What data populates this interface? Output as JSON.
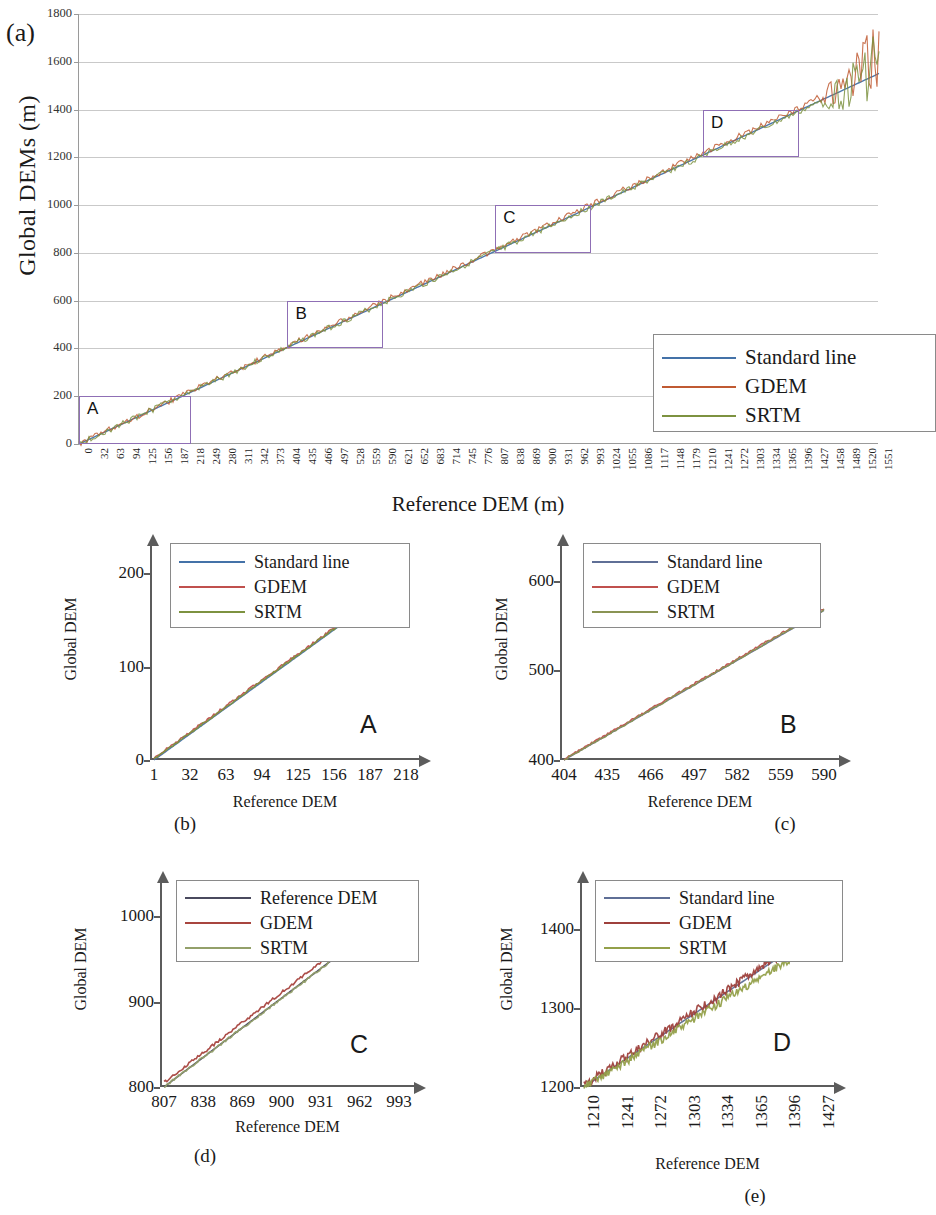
{
  "figure": {
    "panels": [
      {
        "tag": "(a)"
      },
      {
        "tag": "(b)"
      },
      {
        "tag": "(c)"
      },
      {
        "tag": "(d)"
      },
      {
        "tag": "(e)"
      }
    ]
  },
  "panel_a": {
    "tag": "(a)",
    "ylabel": "Global DEMs (m)",
    "xlabel": "Reference DEM (m)",
    "legend": [
      {
        "label": "Standard line",
        "color": "#4472a8"
      },
      {
        "label": "GDEM",
        "color": "#c05a32"
      },
      {
        "label": "SRTM",
        "color": "#7d9240"
      }
    ],
    "yticks": [
      "0",
      "200",
      "400",
      "600",
      "800",
      "1000",
      "1200",
      "1400",
      "1600",
      "1800"
    ],
    "xticks": [
      "0",
      "32",
      "63",
      "94",
      "125",
      "156",
      "187",
      "218",
      "249",
      "280",
      "311",
      "342",
      "373",
      "404",
      "435",
      "466",
      "497",
      "528",
      "559",
      "590",
      "621",
      "652",
      "683",
      "714",
      "745",
      "776",
      "807",
      "838",
      "869",
      "900",
      "931",
      "962",
      "993",
      "1024",
      "1055",
      "1086",
      "1117",
      "1148",
      "1179",
      "1210",
      "1241",
      "1272",
      "1303",
      "1334",
      "1365",
      "1396",
      "1427",
      "1458",
      "1489",
      "1520",
      "1551"
    ],
    "boxes": [
      {
        "label": "A",
        "color": "#8f6fb5"
      },
      {
        "label": "B",
        "color": "#8f6fb5"
      },
      {
        "label": "C",
        "color": "#8f6fb5"
      },
      {
        "label": "D",
        "color": "#8f6fb5"
      }
    ]
  },
  "panel_b": {
    "caption": "(b)",
    "zone": "A",
    "ylabel": "Global DEM",
    "xlabel": "Reference DEM",
    "yticks": [
      "0",
      "100",
      "200"
    ],
    "xticks": [
      "1",
      "32",
      "63",
      "94",
      "125",
      "156",
      "187",
      "218"
    ],
    "legend": [
      {
        "label": "Standard line",
        "color": "#4472a8"
      },
      {
        "label": "GDEM",
        "color": "#c0504d"
      },
      {
        "label": "SRTM",
        "color": "#7d9240"
      }
    ]
  },
  "panel_c": {
    "caption": "(c)",
    "zone": "B",
    "ylabel": "Global DEM",
    "xlabel": "Reference DEM",
    "yticks": [
      "400",
      "500",
      "600"
    ],
    "xticks": [
      "404",
      "435",
      "466",
      "497",
      "582",
      "559",
      "590"
    ],
    "legend": [
      {
        "label": "Standard line",
        "color": "#5f6f96"
      },
      {
        "label": "GDEM",
        "color": "#c0504d"
      },
      {
        "label": "SRTM",
        "color": "#8a9454"
      }
    ]
  },
  "panel_d": {
    "caption": "(d)",
    "zone": "C",
    "ylabel": "Global DEM",
    "xlabel": "Reference DEM",
    "yticks": [
      "800",
      "900",
      "1000"
    ],
    "xticks": [
      "807",
      "838",
      "869",
      "900",
      "931",
      "962",
      "993"
    ],
    "legend": [
      {
        "label": "Reference DEM",
        "color": "#4a4a5e"
      },
      {
        "label": "GDEM",
        "color": "#a8453f"
      },
      {
        "label": "SRTM",
        "color": "#93a06a"
      }
    ]
  },
  "panel_e": {
    "caption": "(e)",
    "zone": "D",
    "ylabel": "Global DEM",
    "xlabel": "Reference DEM",
    "yticks": [
      "1200",
      "1300",
      "1400"
    ],
    "xticks": [
      "1210",
      "1241",
      "1272",
      "1303",
      "1334",
      "1365",
      "1396",
      "1427"
    ],
    "legend": [
      {
        "label": "Standard line",
        "color": "#5f6f96"
      },
      {
        "label": "GDEM",
        "color": "#9e403c"
      },
      {
        "label": "SRTM",
        "color": "#93a04a"
      }
    ]
  },
  "chart_data": [
    {
      "type": "line",
      "panel": "(a)",
      "title": "",
      "xlabel": "Reference DEM (m)",
      "ylabel": "Global DEMs (m)",
      "xlim": [
        0,
        1551
      ],
      "ylim": [
        0,
        1800
      ],
      "grid": true,
      "legend_position": "lower-right",
      "xticks": [
        0,
        32,
        63,
        94,
        125,
        156,
        187,
        218,
        249,
        280,
        311,
        342,
        373,
        404,
        435,
        466,
        497,
        528,
        559,
        590,
        621,
        652,
        683,
        714,
        745,
        776,
        807,
        838,
        869,
        900,
        931,
        962,
        993,
        1024,
        1055,
        1086,
        1117,
        1148,
        1179,
        1210,
        1241,
        1272,
        1303,
        1334,
        1365,
        1396,
        1427,
        1458,
        1489,
        1520,
        1551
      ],
      "yticks": [
        0,
        200,
        400,
        600,
        800,
        1000,
        1200,
        1400,
        1600,
        1800
      ],
      "series": [
        {
          "name": "Standard line",
          "color": "#4472a8",
          "x": [
            0,
            200,
            400,
            600,
            800,
            1000,
            1200,
            1400,
            1500,
            1551
          ],
          "values": [
            0,
            200,
            400,
            600,
            800,
            1000,
            1200,
            1400,
            1500,
            1551
          ]
        },
        {
          "name": "GDEM",
          "color": "#c05a32",
          "x": [
            0,
            200,
            400,
            600,
            800,
            1000,
            1200,
            1400,
            1500,
            1551
          ],
          "values": [
            2,
            204,
            406,
            607,
            808,
            1008,
            1210,
            1408,
            1520,
            1650
          ]
        },
        {
          "name": "SRTM",
          "color": "#7d9240",
          "x": [
            0,
            200,
            400,
            600,
            800,
            1000,
            1200,
            1400,
            1500,
            1551
          ],
          "values": [
            1,
            201,
            401,
            601,
            800,
            1000,
            1198,
            1394,
            1490,
            1630
          ]
        }
      ],
      "annotations": [
        {
          "label": "A",
          "x_range": [
            0,
            218
          ],
          "y_range": [
            0,
            200
          ]
        },
        {
          "label": "B",
          "x_range": [
            404,
            590
          ],
          "y_range": [
            400,
            600
          ]
        },
        {
          "label": "C",
          "x_range": [
            807,
            993
          ],
          "y_range": [
            800,
            1000
          ]
        },
        {
          "label": "D",
          "x_range": [
            1210,
            1396
          ],
          "y_range": [
            1200,
            1400
          ]
        }
      ]
    },
    {
      "type": "line",
      "panel": "(b)",
      "zone": "A",
      "xlabel": "Reference DEM",
      "ylabel": "Global DEM",
      "xlim": [
        1,
        218
      ],
      "ylim": [
        0,
        230
      ],
      "grid": false,
      "legend_position": "upper-left",
      "xticks": [
        1,
        32,
        63,
        94,
        125,
        156,
        187,
        218
      ],
      "yticks": [
        0,
        100,
        200
      ],
      "series": [
        {
          "name": "Standard line",
          "color": "#4472a8",
          "x": [
            1,
            218
          ],
          "values": [
            0,
            195
          ]
        },
        {
          "name": "GDEM",
          "color": "#c0504d",
          "x": [
            1,
            218
          ],
          "values": [
            2,
            197
          ]
        },
        {
          "name": "SRTM",
          "color": "#7d9240",
          "x": [
            1,
            218
          ],
          "values": [
            1,
            196
          ]
        }
      ]
    },
    {
      "type": "line",
      "panel": "(c)",
      "zone": "B",
      "xlabel": "Reference DEM",
      "ylabel": "Global DEM",
      "xlim": [
        404,
        590
      ],
      "ylim": [
        400,
        640
      ],
      "grid": false,
      "legend_position": "upper-left",
      "xticks": [
        404,
        435,
        466,
        497,
        582,
        559,
        590
      ],
      "yticks": [
        400,
        500,
        600
      ],
      "series": [
        {
          "name": "Standard line",
          "color": "#5f6f96",
          "x": [
            404,
            590
          ],
          "values": [
            400,
            567
          ]
        },
        {
          "name": "GDEM",
          "color": "#c0504d",
          "x": [
            404,
            590
          ],
          "values": [
            401,
            569
          ]
        },
        {
          "name": "SRTM",
          "color": "#8a9454",
          "x": [
            404,
            590
          ],
          "values": [
            400,
            568
          ]
        }
      ]
    },
    {
      "type": "line",
      "panel": "(d)",
      "zone": "C",
      "xlabel": "Reference DEM",
      "ylabel": "Global DEM",
      "xlim": [
        800,
        1010
      ],
      "ylim": [
        800,
        1040
      ],
      "grid": false,
      "legend_position": "upper-left",
      "xticks": [
        807,
        838,
        869,
        900,
        931,
        962,
        993
      ],
      "yticks": [
        800,
        900,
        1000
      ],
      "series": [
        {
          "name": "Reference DEM",
          "color": "#4a4a5e",
          "x": [
            800,
            1010
          ],
          "values": [
            800,
            1008
          ]
        },
        {
          "name": "GDEM",
          "color": "#a8453f",
          "x": [
            800,
            1010
          ],
          "values": [
            805,
            1016
          ]
        },
        {
          "name": "SRTM",
          "color": "#93a06a",
          "x": [
            800,
            1010
          ],
          "values": [
            800,
            1007
          ]
        }
      ]
    },
    {
      "type": "line",
      "panel": "(e)",
      "zone": "D",
      "xlabel": "Reference DEM",
      "ylabel": "Global DEM",
      "xlim": [
        1200,
        1440
      ],
      "ylim": [
        1200,
        1460
      ],
      "grid": false,
      "legend_position": "upper-left",
      "xticks": [
        1210,
        1241,
        1272,
        1303,
        1334,
        1365,
        1396,
        1427
      ],
      "yticks": [
        1200,
        1300,
        1400
      ],
      "series": [
        {
          "name": "Standard line",
          "color": "#5f6f96",
          "x": [
            1200,
            1440
          ],
          "values": [
            1200,
            1398
          ]
        },
        {
          "name": "GDEM",
          "color": "#9e403c",
          "x": [
            1200,
            1440
          ],
          "values": [
            1202,
            1400
          ]
        },
        {
          "name": "SRTM",
          "color": "#93a04a",
          "x": [
            1200,
            1440
          ],
          "values": [
            1199,
            1385
          ]
        }
      ]
    }
  ]
}
